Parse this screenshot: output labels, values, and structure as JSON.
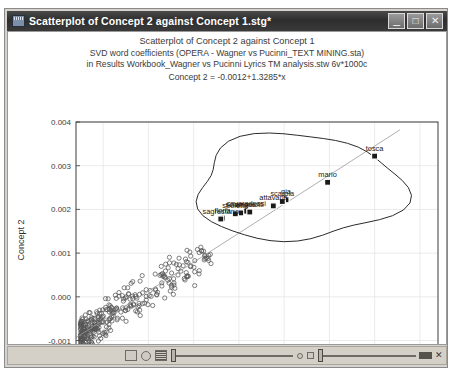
{
  "window": {
    "title": "Scatterplot of Concept 2 against Concept 1.stg*",
    "icon": "statistica-graph-icon",
    "buttons": {
      "minimize": "_",
      "maximize": "□",
      "close": "✕"
    }
  },
  "chart_data": {
    "type": "scatter",
    "title_lines": [
      "Scatterplot of Concept 2 against Concept 1",
      "SVD word coefficients (OPERA - Wagner vs Pucinni_TEXT MINING.sta)",
      "in Results Workbook_Wagner vs Pucinni Lyrics TM analysis.stw 6v*1000c",
      "Concept 2 = -0.0012+1.3285*x"
    ],
    "xlabel": "Concept 1",
    "ylabel": "Concept 2",
    "xlim": [
      0.0002,
      0.0042
    ],
    "ylim": [
      -0.0014,
      0.004
    ],
    "xticks": [
      "0.0005",
      "0.0010",
      "0.0015",
      "0.0020",
      "0.0025",
      "0.0030",
      "0.0035",
      "0.0040"
    ],
    "xtick_values": [
      0.0005,
      0.001,
      0.0015,
      0.002,
      0.0025,
      0.003,
      0.0035,
      0.004
    ],
    "yticks": [
      "0.004",
      "0.003",
      "0.002",
      "0.001",
      "0.000",
      "-0.001"
    ],
    "ytick_values": [
      0.004,
      0.003,
      0.002,
      0.001,
      0.0,
      -0.001
    ],
    "grid": true,
    "legend": "none",
    "fit_line": {
      "intercept": -0.0012,
      "slope": 1.3285
    },
    "annotations": [
      {
        "label": "tosca",
        "x": 0.0035,
        "y": 0.00322
      },
      {
        "label": "mario",
        "x": 0.00298,
        "y": 0.00262
      },
      {
        "label": "gia",
        "x": 0.00252,
        "y": 0.00222
      },
      {
        "label": "scarpia",
        "x": 0.00248,
        "y": 0.00218
      },
      {
        "label": "attavanti",
        "x": 0.00238,
        "y": 0.00208
      },
      {
        "label": "cavaradossi",
        "x": 0.00208,
        "y": 0.00196
      },
      {
        "label": "angelotti",
        "x": 0.00212,
        "y": 0.00194
      },
      {
        "label": "sciarrone",
        "x": 0.00202,
        "y": 0.00192
      },
      {
        "label": "spoletta",
        "x": 0.00196,
        "y": 0.0019
      },
      {
        "label": "floria",
        "x": 0.00182,
        "y": 0.0018
      },
      {
        "label": "sagrestano",
        "x": 0.0018,
        "y": 0.00178
      }
    ],
    "selection_outline": "lasso-ellipse around labelled cluster",
    "cloud_point_count": 1000,
    "marker_styles": {
      "cloud": "open-circle",
      "labelled": "filled-square"
    }
  },
  "statusbar": {
    "tools": [
      "curve-icon",
      "point-icon",
      "bars-icon"
    ],
    "sliders": [
      "horizontal-slider-left",
      "horizontal-slider-right"
    ],
    "end": [
      "handle-pill",
      "close-x"
    ]
  }
}
